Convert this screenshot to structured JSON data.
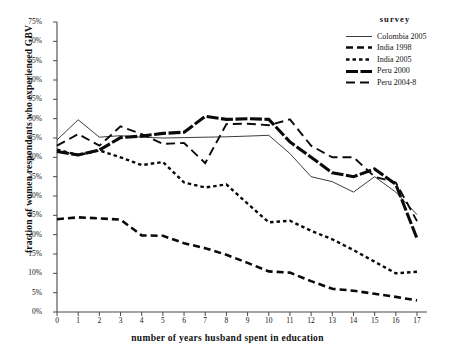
{
  "chart_data": {
    "type": "line",
    "title": "",
    "xlabel": "number of years husband spent in education",
    "ylabel": "fraction of women respondents who experienced GBV",
    "legend_title": "survey",
    "legend_position": "top-right",
    "grid": false,
    "xlim": [
      0,
      17
    ],
    "ylim": [
      0,
      75
    ],
    "x": [
      0,
      1,
      2,
      3,
      4,
      5,
      6,
      7,
      8,
      9,
      10,
      11,
      12,
      13,
      14,
      15,
      16,
      17
    ],
    "xticks": [
      "0",
      "1",
      "2",
      "3",
      "4",
      "5",
      "6",
      "7",
      "8",
      "9",
      "10",
      "11",
      "12",
      "13",
      "14",
      "15",
      "16",
      "17"
    ],
    "yticks": [
      "0%",
      "5%",
      "10%",
      "15%",
      "20%",
      "25%",
      "30%",
      "35%",
      "40%",
      "45%",
      "50%",
      "55%",
      "60%",
      "65%",
      "70%",
      "75%"
    ],
    "ytick_values": [
      0,
      5,
      10,
      15,
      20,
      25,
      30,
      35,
      40,
      45,
      50,
      55,
      60,
      65,
      70,
      75
    ],
    "series": [
      {
        "name": "Colombia 2005",
        "style": "solid",
        "color": "#0a0a0a",
        "width": 0.8,
        "dash": "none",
        "values": [
          44.5,
          49.7,
          45.2,
          45.6,
          45.2,
          45.0,
          45.1,
          45.2,
          45.3,
          45.5,
          45.7,
          41.0,
          35.0,
          33.7,
          31.0,
          35.0,
          31.0,
          25.2
        ]
      },
      {
        "name": "India 1998",
        "style": "dashed-thick",
        "color": "#0a0a0a",
        "width": 2.6,
        "dash": "7,4",
        "values": [
          24.0,
          24.5,
          24.2,
          23.9,
          19.8,
          19.7,
          17.8,
          16.5,
          14.8,
          12.7,
          10.5,
          10.2,
          8.0,
          6.0,
          5.5,
          4.7,
          3.9,
          3.0
        ]
      },
      {
        "name": "India 2005",
        "style": "dotted-thick",
        "color": "#0a0a0a",
        "width": 2.4,
        "dash": "3.5,3",
        "values": [
          42.0,
          40.6,
          41.8,
          40.0,
          38.0,
          38.8,
          33.5,
          32.2,
          33.0,
          28.0,
          23.2,
          23.6,
          21.0,
          18.8,
          16.0,
          13.0,
          10.0,
          10.4
        ]
      },
      {
        "name": "Peru 2000",
        "style": "solid-thick",
        "color": "#0a0a0a",
        "width": 3.1,
        "dash": "12,2.5",
        "values": [
          41.5,
          40.6,
          41.9,
          45.1,
          45.5,
          46.2,
          46.5,
          50.6,
          49.8,
          50.0,
          49.8,
          44.0,
          40.0,
          36.0,
          35.0,
          37.0,
          33.0,
          19.0
        ]
      },
      {
        "name": "Peru 2004-8",
        "style": "dashed",
        "color": "#0a0a0a",
        "width": 1.9,
        "dash": "9,5",
        "values": [
          43.0,
          46.0,
          43.0,
          48.0,
          46.0,
          43.5,
          43.7,
          38.5,
          48.6,
          48.7,
          48.3,
          49.8,
          43.0,
          40.0,
          40.0,
          35.0,
          33.5,
          23.5
        ]
      }
    ]
  }
}
